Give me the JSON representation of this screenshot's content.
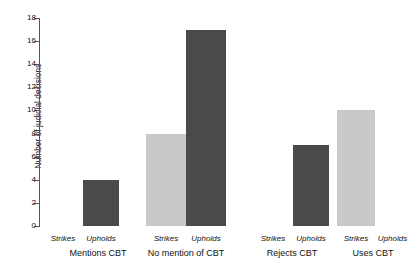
{
  "chart_data": {
    "type": "bar",
    "title": "",
    "xlabel": "",
    "ylabel": "Number of judicial decisions",
    "ylim": [
      0,
      18
    ],
    "ytick_step": 2,
    "yticks": [
      "18",
      "16",
      "14",
      "12",
      "10",
      "8",
      "6",
      "4",
      "2",
      "0"
    ],
    "grid": false,
    "legend": "none",
    "categories": [
      "Mentions CBT",
      "No mention of CBT",
      "Rejects CBT",
      "Uses CBT"
    ],
    "subcategories": [
      "Strikes",
      "Upholds"
    ],
    "series": [
      {
        "name": "Strikes",
        "values": [
          0,
          8,
          0,
          10
        ],
        "color": "#c9c9c9"
      },
      {
        "name": "Upholds",
        "values": [
          4,
          17,
          7,
          0
        ],
        "color": "#4a4a4a"
      }
    ],
    "groups": [
      {
        "label": "Mentions CBT",
        "bars": [
          {
            "sub": "Strikes",
            "value": 0,
            "color": "#c9c9c9"
          },
          {
            "sub": "Upholds",
            "value": 4,
            "color": "#4a4a4a"
          }
        ]
      },
      {
        "label": "No mention of CBT",
        "bars": [
          {
            "sub": "Strikes",
            "value": 8,
            "color": "#c9c9c9"
          },
          {
            "sub": "Upholds",
            "value": 17,
            "color": "#4a4a4a"
          }
        ]
      },
      {
        "label": "Rejects CBT",
        "bars": [
          {
            "sub": "Strikes",
            "value": 0,
            "color": "#c9c9c9"
          },
          {
            "sub": "Upholds",
            "value": 7,
            "color": "#4a4a4a"
          }
        ]
      },
      {
        "label": "Uses CBT",
        "bars": [
          {
            "sub": "Strikes",
            "value": 10,
            "color": "#c9c9c9"
          },
          {
            "sub": "Upholds",
            "value": 0,
            "color": "#4a4a4a"
          }
        ]
      }
    ]
  },
  "axis": {
    "y_title": "Number of judicial decisions"
  },
  "colors": {
    "light_bar": "#c9c9c9",
    "dark_bar": "#4a4a4a",
    "axis": "#555555",
    "background": "#ffffff",
    "text": "#111111"
  }
}
